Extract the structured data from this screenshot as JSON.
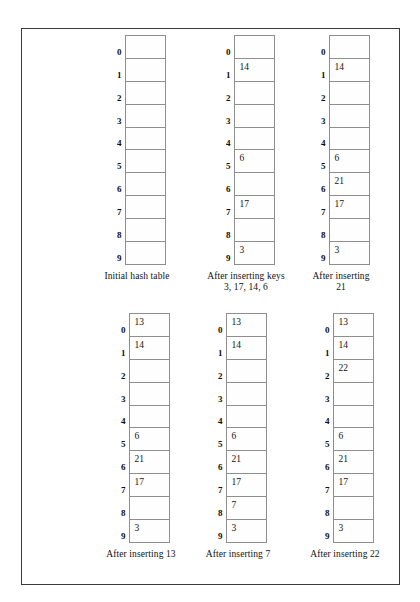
{
  "figure": {
    "row_labels": [
      "0",
      "1",
      "2",
      "3",
      "4",
      "5",
      "6",
      "7",
      "8",
      "9"
    ],
    "panels": [
      {
        "id": "initial-hash-table",
        "caption": "Initial hash table",
        "slots": [
          "",
          "",
          "",
          "",
          "",
          "",
          "",
          "",
          "",
          ""
        ]
      },
      {
        "id": "after-inserting-keys-3-17-14-6",
        "caption": "After inserting keys\n3, 17, 14, 6",
        "slots": [
          "",
          "14",
          "",
          "",
          "",
          "6",
          "",
          "17",
          "",
          "3"
        ]
      },
      {
        "id": "after-inserting-21",
        "caption": "After inserting\n21",
        "slots": [
          "",
          "14",
          "",
          "",
          "",
          "6",
          "21",
          "17",
          "",
          "3"
        ]
      },
      {
        "id": "after-inserting-13",
        "caption": "After inserting 13",
        "slots": [
          "13",
          "14",
          "",
          "",
          "",
          "6",
          "21",
          "17",
          "",
          "3"
        ]
      },
      {
        "id": "after-inserting-7",
        "caption": "After inserting 7",
        "slots": [
          "13",
          "14",
          "",
          "",
          "",
          "6",
          "21",
          "17",
          "7",
          "3"
        ]
      },
      {
        "id": "after-inserting-22",
        "caption": "After inserting 22",
        "slots": [
          "13",
          "14",
          "22",
          "",
          "",
          "6",
          "21",
          "17",
          "",
          "3"
        ]
      }
    ],
    "colors": {
      "frame_border": "#3a3a3a",
      "cell_border": "#8e8e8e",
      "text": "#111111",
      "background": "#ffffff"
    }
  }
}
